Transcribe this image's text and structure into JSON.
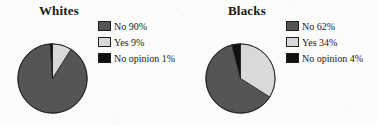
{
  "page": {
    "background_color": "#fbfbfa",
    "width": 377,
    "height": 125
  },
  "palette": {
    "no_color": "#555555",
    "yes_color": "#d9d9d9",
    "no_opinion_color": "#111111",
    "outline_color": "#1d1d1d",
    "text_color": "#1a1a1a"
  },
  "charts": [
    {
      "title": "Whites",
      "legend": [
        {
          "label": "No 90%",
          "color": "#555555",
          "swatch_name": "legend-swatch-no"
        },
        {
          "label": "Yes 9%",
          "color": "#d9d9d9",
          "swatch_name": "legend-swatch-yes"
        },
        {
          "label": "No opinion 1%",
          "color": "#111111",
          "swatch_name": "legend-swatch-no-opinion"
        }
      ]
    },
    {
      "title": "Blacks",
      "legend": [
        {
          "label": "No 62%",
          "color": "#555555",
          "swatch_name": "legend-swatch-no"
        },
        {
          "label": "Yes 34%",
          "color": "#d9d9d9",
          "swatch_name": "legend-swatch-yes"
        },
        {
          "label": "No opinion 4%",
          "color": "#111111",
          "swatch_name": "legend-swatch-no-opinion"
        }
      ]
    }
  ],
  "chart_data": [
    {
      "type": "pie",
      "title": "Whites",
      "labels": [
        "No",
        "Yes",
        "No opinion"
      ],
      "values": [
        90,
        9,
        1
      ],
      "value_unit": "percent",
      "data_labels": [
        "No 90%",
        "Yes 9%",
        "No opinion 1%"
      ],
      "colors": [
        "#555555",
        "#d9d9d9",
        "#111111"
      ],
      "start_angle_deg": 0,
      "direction": "clockwise",
      "slice_order": [
        "Yes",
        "No",
        "No opinion"
      ],
      "legend_position": "right",
      "grid": false,
      "xlabel": "",
      "ylabel": ""
    },
    {
      "type": "pie",
      "title": "Blacks",
      "labels": [
        "No",
        "Yes",
        "No opinion"
      ],
      "values": [
        62,
        34,
        4
      ],
      "value_unit": "percent",
      "data_labels": [
        "No 62%",
        "Yes 34%",
        "No opinion 4%"
      ],
      "colors": [
        "#555555",
        "#d9d9d9",
        "#111111"
      ],
      "start_angle_deg": 0,
      "direction": "clockwise",
      "slice_order": [
        "Yes",
        "No",
        "No opinion"
      ],
      "legend_position": "right",
      "grid": false,
      "xlabel": "",
      "ylabel": ""
    }
  ]
}
